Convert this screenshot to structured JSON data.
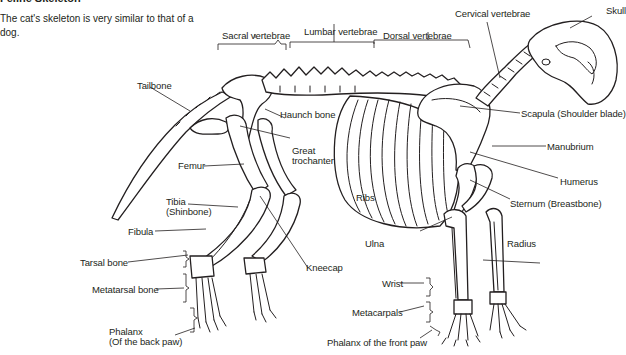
{
  "title": "Feline Skeleton",
  "intro": "The cat's skeleton is very similar to that of a dog.",
  "labels": {
    "sacral_vertebrae": "Sacral vertebrae",
    "lumbar_vertebrae": "Lumbar vertebrae",
    "dorsal_vertebrae": "Dorsal vertebrae",
    "cervical_vertebrae": "Cervical vertebrae",
    "skull": "Skull",
    "tailbone": "Tailbone",
    "haunch_bone": "Haunch bone",
    "great_trochanter_1": "Great",
    "great_trochanter_2": "trochanter",
    "femur": "Femur",
    "tibia_1": "Tibia",
    "tibia_2": "(Shinbone)",
    "fibula": "Fibula",
    "tarsal_bone": "Tarsal bone",
    "metatarsal_bone": "Metatarsal bone",
    "phalanx_back_1": "Phalanx",
    "phalanx_back_2": "(Of the back paw)",
    "kneecap": "Kneecap",
    "ribs": "Ribs",
    "ulna": "Ulna",
    "wrist": "Wrist",
    "metacarpals": "Metacarpals",
    "phalanx_front": "Phalanx of the front paw",
    "scapula": "Scapula (Shoulder blade)",
    "manubrium": "Manubrium",
    "humerus": "Humerus",
    "sternum": "Sternum (Breastbone)",
    "radius": "Radius"
  },
  "colors": {
    "ink": "#231f20",
    "background": "#ffffff"
  }
}
